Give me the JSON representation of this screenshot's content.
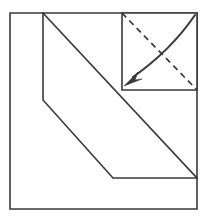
{
  "figure": {
    "type": "geometric-fold-diagram",
    "canvas": {
      "width": 207,
      "height": 223,
      "background": "#ffffff"
    },
    "stroke_color": "#3a3a3a",
    "colors": {
      "line": "#3a3a3a",
      "background": "#ffffff",
      "fill": "#ffffff"
    },
    "outer_square": {
      "name": "outer-square",
      "x1": 10,
      "y1": 13,
      "x2": 197,
      "y2": 209,
      "points": "10,13 197,13 197,209 10,209"
    },
    "main_diagonal": {
      "name": "main-diagonal",
      "from_x": 43,
      "from_y": 13,
      "to_x": 197,
      "to_y": 178
    },
    "flap_outline": {
      "name": "folded-flap-outline",
      "points": "43,13 43,100 113,178 197,178"
    },
    "flap_region": {
      "name": "flap-region",
      "points": "43,13 197,178 113,178 43,100"
    },
    "inset_square": {
      "name": "inset-square",
      "x1": 122,
      "y1": 13,
      "x2": 197,
      "y2": 90,
      "points": "122,13 197,13 197,90 122,90"
    },
    "inset_dashed_diagonal": {
      "name": "inset-dashed-diagonal",
      "from_x": 122,
      "from_y": 13,
      "to_x": 197,
      "to_y": 90,
      "style": "dashed"
    },
    "fold_arrow": {
      "name": "fold-direction-arrow",
      "path": "M 195 15 C 182 34 160 58 133 77",
      "direction": "top-right to bottom-left",
      "head_points": "124,86 138,72 135,80 142,79",
      "style": "curved-solid-with-arrowhead"
    }
  }
}
